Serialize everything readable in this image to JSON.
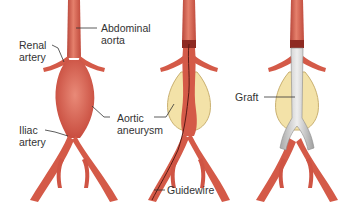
{
  "diagram": {
    "panels": [
      {
        "name": "aneurysm",
        "labels": {
          "abdominal_aorta": [
            "Abdominal",
            "aorta"
          ],
          "renal_artery": [
            "Renal",
            "artery"
          ],
          "iliac_artery": [
            "Iliac",
            "artery"
          ],
          "aortic_aneurysm": [
            "Aortic",
            "aneurysm"
          ]
        }
      },
      {
        "name": "guidewire-insertion",
        "labels": {
          "guidewire": "Guidewire"
        }
      },
      {
        "name": "graft-placed",
        "labels": {
          "graft": "Graft"
        }
      }
    ],
    "colors": {
      "artery": "#d45a48",
      "artery_dark": "#a8362c",
      "artery_light": "#e98a78",
      "aneurysm_sac": "#f3e2a8",
      "sac_outline": "#c9b070",
      "graft": "#d6d6d6",
      "graft_shadow": "#9c9c9c",
      "leader_line": "#333333",
      "text": "#333333"
    }
  }
}
